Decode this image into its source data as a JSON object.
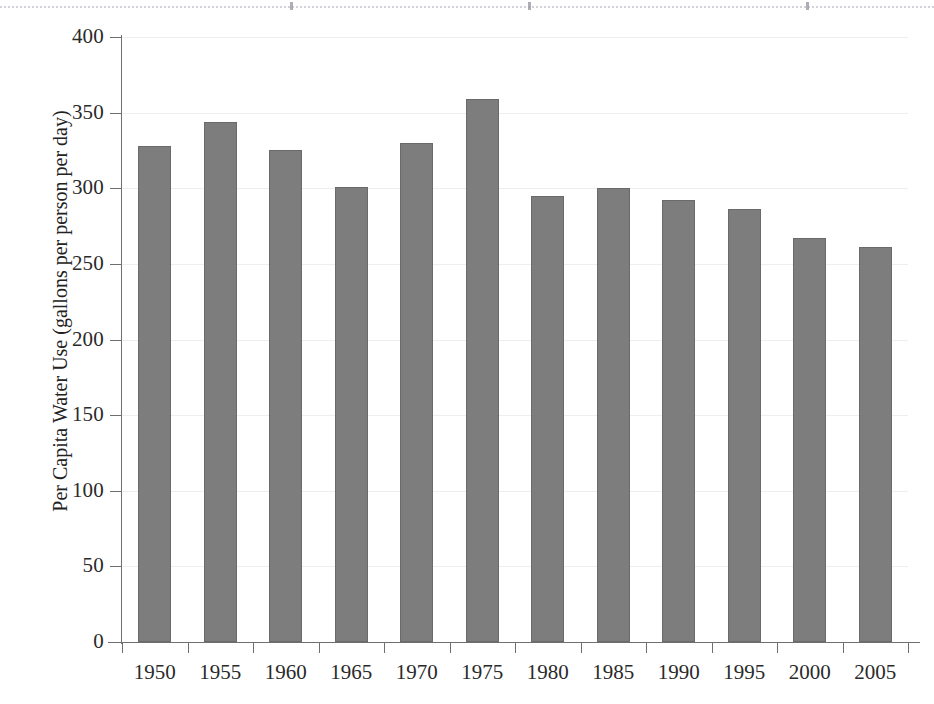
{
  "chart_data": {
    "type": "bar",
    "title": "",
    "xlabel": "",
    "ylabel": "Per Capita Water Use (gallons per person per day)",
    "categories": [
      "1950",
      "1955",
      "1960",
      "1965",
      "1970",
      "1975",
      "1980",
      "1985",
      "1990",
      "1995",
      "2000",
      "2005"
    ],
    "values": [
      328,
      344,
      325,
      301,
      330,
      359,
      295,
      300,
      292,
      286,
      267,
      261
    ],
    "ylim": [
      0,
      400
    ],
    "ytick_labels": [
      "0",
      "50",
      "100",
      "150",
      "200",
      "250",
      "300",
      "350",
      "400"
    ],
    "ytick_values": [
      0,
      50,
      100,
      150,
      200,
      250,
      300,
      350,
      400
    ],
    "grid": true,
    "grid_axis": "y",
    "legend": false,
    "legend_position": "none",
    "bar_color": "#7d7d7d",
    "bar_edge_color": "#6a6a6a",
    "grid_color": "#eeeef2",
    "axis_color": "#6f6f6f",
    "background_color": "#ffffff",
    "series": [
      {
        "name": "Per Capita Water Use",
        "values": [
          328,
          344,
          325,
          301,
          330,
          359,
          295,
          300,
          292,
          286,
          267,
          261
        ]
      }
    ]
  }
}
